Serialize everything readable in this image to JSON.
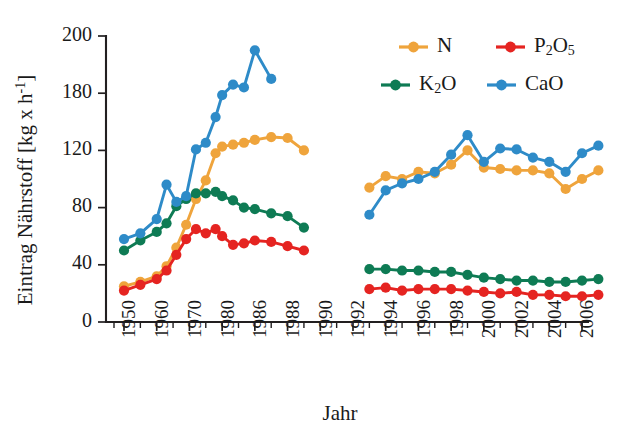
{
  "chart_data": {
    "type": "line",
    "title": "",
    "xlabel": "Jahr",
    "ylabel": "Eintrag Nährstoff [kg x h⁻¹]",
    "ylabel_parts": {
      "prefix": "Eintrag Nährstoff [kg x h",
      "exponent": "-1",
      "suffix": "]"
    },
    "ylim": [
      0,
      200
    ],
    "yticks": [
      0,
      40,
      80,
      120,
      180,
      200
    ],
    "ytick_labels": [
      "0",
      "40",
      "80",
      "120",
      "180",
      "200"
    ],
    "xlim": [
      1949,
      2008
    ],
    "xtick_labels": [
      "1950",
      "1960",
      "1970",
      "1980",
      "1986",
      "1988",
      "1990",
      "1992",
      "1994",
      "1996",
      "1998",
      "2000",
      "2002",
      "2004",
      "2006"
    ],
    "xticks": [
      1950,
      1960,
      1970,
      1980,
      1986,
      1988,
      1990,
      1992,
      1994,
      1996,
      1998,
      2000,
      2002,
      2004,
      2006
    ],
    "grid": false,
    "legend_position": "top-right",
    "data_gap": {
      "from": 1989,
      "to": 1993,
      "note": "no data between segments"
    },
    "series": [
      {
        "name": "N",
        "label": "N",
        "color": "#EFA43C",
        "x": [
          1950,
          1955,
          1960,
          1963,
          1966,
          1969,
          1972,
          1975,
          1978,
          1980,
          1982,
          1984,
          1986,
          1987,
          1988,
          1989,
          1993,
          1994,
          1995,
          1996,
          1997,
          1998,
          1999,
          2000,
          2001,
          2002,
          2003,
          2004,
          2005,
          2006,
          2007
        ],
        "y": [
          25,
          28,
          32,
          39,
          52,
          68,
          86,
          99,
          118,
          124,
          126,
          128,
          131,
          134,
          133,
          120,
          94,
          102,
          100,
          105,
          104,
          110,
          120,
          108,
          107,
          106,
          106,
          104,
          93,
          100,
          106
        ]
      },
      {
        "name": "P2O5",
        "label": "P₂O₅",
        "label_main": "P",
        "label_sub1": "2",
        "label_mid": "O",
        "label_sub2": "5",
        "color": "#E52421",
        "x": [
          1950,
          1955,
          1960,
          1963,
          1966,
          1969,
          1972,
          1975,
          1978,
          1980,
          1982,
          1984,
          1986,
          1987,
          1988,
          1989,
          1993,
          1994,
          1995,
          1996,
          1997,
          1998,
          1999,
          2000,
          2001,
          2002,
          2003,
          2004,
          2005,
          2006,
          2007
        ],
        "y": [
          22,
          26,
          30,
          36,
          47,
          58,
          65,
          62,
          65,
          60,
          54,
          55,
          57,
          56,
          53,
          50,
          23,
          24,
          22,
          23,
          23,
          23,
          22,
          21,
          20,
          21,
          19,
          19,
          18,
          18,
          19
        ]
      },
      {
        "name": "K2O",
        "label": "K₂O",
        "label_main": "K",
        "label_sub1": "2",
        "label_mid": "O",
        "color": "#0E7B54",
        "x": [
          1950,
          1955,
          1960,
          1963,
          1966,
          1969,
          1972,
          1975,
          1978,
          1980,
          1982,
          1984,
          1986,
          1987,
          1988,
          1989,
          1993,
          1994,
          1995,
          1996,
          1997,
          1998,
          1999,
          2000,
          2001,
          2002,
          2003,
          2004,
          2005,
          2006,
          2007
        ],
        "y": [
          50,
          57,
          63,
          69,
          81,
          86,
          90,
          90,
          91,
          88,
          85,
          80,
          79,
          76,
          74,
          66,
          37,
          37,
          36,
          36,
          35,
          35,
          33,
          31,
          30,
          29,
          29,
          28,
          28,
          29,
          30
        ]
      },
      {
        "name": "CaO",
        "label": "CaO",
        "color": "#2E8BC8",
        "x": [
          1950,
          1955,
          1960,
          1963,
          1966,
          1969,
          1972,
          1975,
          1978,
          1980,
          1982,
          1984,
          1986,
          1987,
          1988,
          1989,
          1993,
          1994,
          1995,
          1996,
          1997,
          1998,
          1999,
          2000,
          2001,
          2002,
          2003,
          2004,
          2005,
          2006,
          2007
        ],
        "y": [
          58,
          62,
          72,
          96,
          84,
          88,
          121,
          128,
          155,
          178,
          183,
          182,
          195,
          185,
          null,
          null,
          75,
          92,
          97,
          100,
          105,
          117,
          136,
          112,
          122,
          121,
          115,
          112,
          105,
          118,
          125
        ]
      }
    ]
  },
  "legend": {
    "entries": [
      {
        "key": "N",
        "label": "N",
        "color": "#EFA43C"
      },
      {
        "key": "P2O5",
        "label": "P₂O₅",
        "color": "#E52421"
      },
      {
        "key": "K2O",
        "label": "K₂O",
        "color": "#0E7B54"
      },
      {
        "key": "CaO",
        "label": "CaO",
        "color": "#2E8BC8"
      }
    ]
  },
  "colors": {
    "n": "#EFA43C",
    "p2o5": "#E52421",
    "k2o": "#0E7B54",
    "cao": "#2E8BC8",
    "axis": "#221f20",
    "background": "#ffffff"
  }
}
